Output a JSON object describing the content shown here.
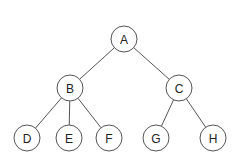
{
  "diagram": {
    "type": "tree",
    "node_radius": 13,
    "stroke_color": "#555555",
    "text_color": "#222222",
    "nodes": [
      {
        "id": "A",
        "label": "A",
        "x": 124,
        "y": 39
      },
      {
        "id": "B",
        "label": "B",
        "x": 70,
        "y": 88
      },
      {
        "id": "C",
        "label": "C",
        "x": 179,
        "y": 88
      },
      {
        "id": "D",
        "label": "D",
        "x": 27,
        "y": 138
      },
      {
        "id": "E",
        "label": "E",
        "x": 69,
        "y": 138
      },
      {
        "id": "F",
        "label": "F",
        "x": 109,
        "y": 138
      },
      {
        "id": "G",
        "label": "G",
        "x": 156,
        "y": 138
      },
      {
        "id": "H",
        "label": "H",
        "x": 213,
        "y": 138
      }
    ],
    "edges": [
      {
        "from": "A",
        "to": "B"
      },
      {
        "from": "A",
        "to": "C"
      },
      {
        "from": "B",
        "to": "D"
      },
      {
        "from": "B",
        "to": "E"
      },
      {
        "from": "B",
        "to": "F"
      },
      {
        "from": "C",
        "to": "G"
      },
      {
        "from": "C",
        "to": "H"
      }
    ]
  }
}
